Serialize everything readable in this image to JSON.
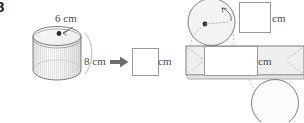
{
  "problem": {
    "number": "8"
  },
  "figure": {
    "type": "cylinder-to-net-diagram",
    "solid": {
      "name": "cylinder",
      "diameter_label": "6 cm",
      "height_label": "8 cm"
    },
    "transform_arrow": "right-arrow-icon",
    "answers": [
      {
        "name": "radius-answer",
        "value": "",
        "unit": "cm"
      },
      {
        "name": "height-answer",
        "value": "",
        "unit": "cm"
      },
      {
        "name": "circumference-answer",
        "value": "",
        "unit": "cm"
      }
    ],
    "net_parts": [
      {
        "name": "top-circle"
      },
      {
        "name": "lateral-rectangle"
      },
      {
        "name": "bottom-circle"
      }
    ],
    "units": {
      "cm_1": "cm",
      "cm_2": "cm",
      "cm_3": "cm"
    }
  },
  "colors": {
    "outline": "#6f6f6f",
    "dashed": "#9d9d9d",
    "fill_light": "#f2f2f2",
    "fill_white": "#ffffff",
    "text": "#4a4a4a",
    "arrow": "#6e6e6e"
  }
}
